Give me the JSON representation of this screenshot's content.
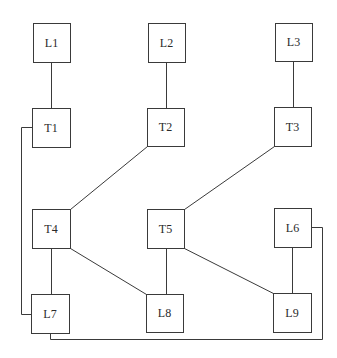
{
  "diagram": {
    "type": "network-topology",
    "colors": {
      "stroke": "#3a3a3a",
      "text": "#2a2a2a",
      "background": "#ffffff",
      "node_fill": "#ffffff"
    },
    "nodes": [
      {
        "id": "L1",
        "label": "L1",
        "x": 33,
        "y": 23,
        "w": 37,
        "h": 39
      },
      {
        "id": "L2",
        "label": "L2",
        "x": 148,
        "y": 23,
        "w": 37,
        "h": 39
      },
      {
        "id": "L3",
        "label": "L3",
        "x": 275,
        "y": 23,
        "w": 37,
        "h": 38
      },
      {
        "id": "T1",
        "label": "T1",
        "x": 32,
        "y": 108,
        "w": 38,
        "h": 39
      },
      {
        "id": "T2",
        "label": "T2",
        "x": 147,
        "y": 108,
        "w": 37,
        "h": 38
      },
      {
        "id": "T3",
        "label": "T3",
        "x": 274,
        "y": 107,
        "w": 37,
        "h": 39
      },
      {
        "id": "T4",
        "label": "T4",
        "x": 32,
        "y": 209,
        "w": 38,
        "h": 39
      },
      {
        "id": "T5",
        "label": "T5",
        "x": 147,
        "y": 209,
        "w": 37,
        "h": 39
      },
      {
        "id": "L6",
        "label": "L6",
        "x": 274,
        "y": 208,
        "w": 37,
        "h": 39
      },
      {
        "id": "L7",
        "label": "L7",
        "x": 31,
        "y": 294,
        "w": 38,
        "h": 39
      },
      {
        "id": "L8",
        "label": "L8",
        "x": 146,
        "y": 294,
        "w": 37,
        "h": 38
      },
      {
        "id": "L9",
        "label": "L9",
        "x": 273,
        "y": 293,
        "w": 38,
        "h": 39
      }
    ],
    "edges": [
      {
        "from": "L1",
        "to": "T1",
        "points": [
          [
            51,
            62
          ],
          [
            51,
            108
          ]
        ]
      },
      {
        "from": "L2",
        "to": "T2",
        "points": [
          [
            166,
            62
          ],
          [
            166,
            108
          ]
        ]
      },
      {
        "from": "L3",
        "to": "T3",
        "points": [
          [
            293,
            61
          ],
          [
            293,
            107
          ]
        ]
      },
      {
        "from": "T2",
        "to": "T4",
        "points": [
          [
            147,
            146
          ],
          [
            70,
            209
          ]
        ]
      },
      {
        "from": "T3",
        "to": "T5",
        "points": [
          [
            274,
            146
          ],
          [
            184,
            209
          ]
        ]
      },
      {
        "from": "T4",
        "to": "L7",
        "points": [
          [
            51,
            248
          ],
          [
            51,
            294
          ]
        ]
      },
      {
        "from": "T4",
        "to": "L8",
        "points": [
          [
            70,
            248
          ],
          [
            146,
            294
          ]
        ]
      },
      {
        "from": "T5",
        "to": "L8",
        "points": [
          [
            166,
            248
          ],
          [
            166,
            294
          ]
        ]
      },
      {
        "from": "T5",
        "to": "L9",
        "points": [
          [
            184,
            248
          ],
          [
            273,
            293
          ]
        ]
      },
      {
        "from": "L6",
        "to": "L9",
        "points": [
          [
            292,
            247
          ],
          [
            292,
            293
          ]
        ]
      },
      {
        "from": "T1",
        "to": "L7",
        "points": [
          [
            32,
            127
          ],
          [
            21,
            127
          ],
          [
            21,
            314
          ],
          [
            31,
            314
          ]
        ]
      },
      {
        "from": "L7",
        "to": "L6",
        "points": [
          [
            50,
            333
          ],
          [
            50,
            339
          ],
          [
            322,
            339
          ],
          [
            322,
            227
          ],
          [
            311,
            227
          ]
        ]
      }
    ]
  }
}
